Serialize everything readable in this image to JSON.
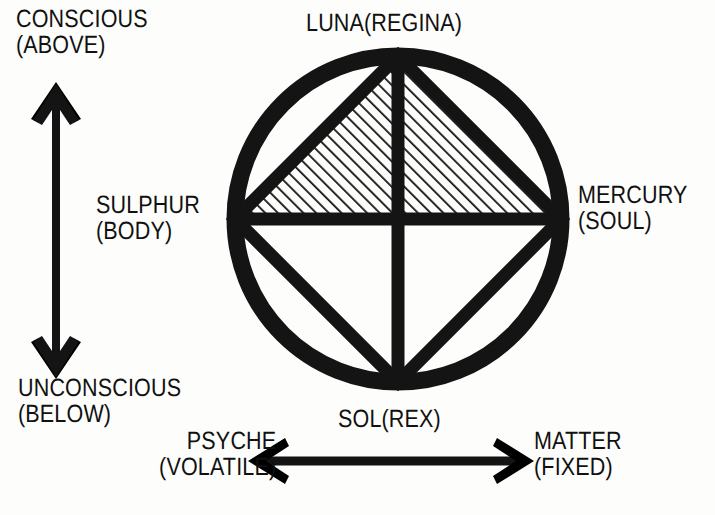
{
  "figure": {
    "background_color": "#fdfdfb",
    "ink_color": "#141414"
  },
  "labels": {
    "top_left": {
      "line1": "CONSCIOUS",
      "line2": "(ABOVE)"
    },
    "top_center": {
      "line1": "LUNA(REGINA)",
      "line2": ""
    },
    "mid_left": {
      "line1": "SULPHUR",
      "line2": "(BODY)"
    },
    "mid_right": {
      "line1": "MERCURY",
      "line2": "(SOUL)"
    },
    "bottom_left": {
      "line1": "UNCONSCIOUS",
      "line2": "(BELOW)"
    },
    "bottom_center": {
      "line1": "SOL(REX)",
      "line2": ""
    },
    "arrow_left": {
      "line1": "PSYCHE",
      "line2": "(VOLATILE)"
    },
    "arrow_right": {
      "line1": "MATTER",
      "line2": "(FIXED)"
    }
  },
  "diagram": {
    "circle": {
      "cx": 398,
      "cy": 219,
      "r": 163,
      "stroke_width": 17
    },
    "diamond_vertices": {
      "top": [
        398,
        56
      ],
      "right": [
        561,
        219
      ],
      "bottom": [
        398,
        382
      ],
      "left": [
        235,
        219
      ]
    },
    "cross": {
      "vertical": {
        "x": 398,
        "y1": 56,
        "y2": 382
      },
      "horizontal": {
        "y": 219,
        "x1": 235,
        "x2": 561
      }
    },
    "hatched_regions": [
      {
        "name": "upper-left-triangle",
        "vertices": [
          [
            235,
            219
          ],
          [
            398,
            56
          ],
          [
            398,
            219
          ]
        ],
        "hatch_angle_deg": 45,
        "hatch_spacing_px": 9
      },
      {
        "name": "upper-right-triangle",
        "vertices": [
          [
            398,
            56
          ],
          [
            561,
            219
          ],
          [
            398,
            219
          ]
        ],
        "hatch_angle_deg": 45,
        "hatch_spacing_px": 9
      }
    ],
    "line_width": 13
  },
  "arrows": {
    "vertical": {
      "name": "conscious-unconscious-axis",
      "x": 56,
      "y_top": 84,
      "y_bottom": 377,
      "double_headed": true,
      "shaft_width": 8,
      "head_length": 34,
      "head_half_width": 23
    },
    "horizontal": {
      "name": "psyche-matter-axis",
      "y": 461,
      "x_left": 250,
      "x_right": 532,
      "double_headed": true,
      "shaft_width": 8,
      "head_length": 32,
      "head_half_width": 22
    }
  }
}
